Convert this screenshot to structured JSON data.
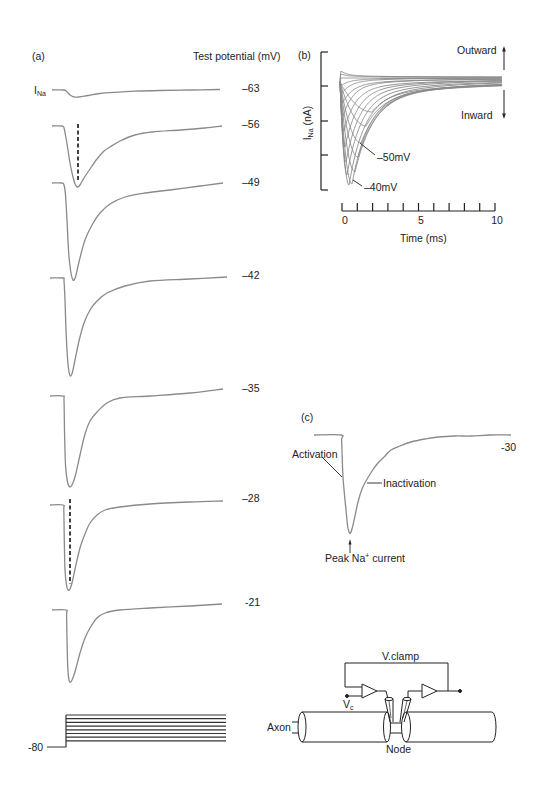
{
  "panels": {
    "a": {
      "label": "(a)",
      "legend_title": "Test potential (mV)",
      "current_main": "I",
      "current_sub": "Na",
      "holding_label": "-80",
      "trace_labels": [
        "–63",
        "–56",
        "–49",
        "–42",
        "–35",
        "–28",
        "-21"
      ]
    },
    "b": {
      "label": "(b)",
      "ylabel_main": "I",
      "ylabel_sub": "Na",
      "ylabel_unit": " (nA)",
      "xlabel": "Time (ms)",
      "xtick_labels": [
        "0",
        "5",
        "10"
      ],
      "outward_label": "Outward",
      "inward_label": "Inward",
      "annotation_50": "–50mV",
      "annotation_40": "–40mV"
    },
    "c": {
      "label": "(c)",
      "potential_label": "-30",
      "activation_label": "Activation",
      "inactivation_label": "Inactivation",
      "peak_main": "Peak Na",
      "peak_sup": "+",
      "peak_rest": " current"
    },
    "d": {
      "vclamp_label": "V.clamp",
      "vc_main": "V",
      "vc_sub": "c",
      "axon_label": "Axon",
      "node_label": "Node"
    }
  },
  "colors": {
    "trace": "#8a8a8a",
    "axis": "#222222",
    "step": "#333333",
    "text": "#222222",
    "background": "#ffffff"
  },
  "chart_data": [
    {
      "panel": "a",
      "type": "line",
      "title": "(a)",
      "legend_title": "Test potential (mV)",
      "ylabel": "INa",
      "xlabel": "",
      "grid": false,
      "voltage_protocol": {
        "holding_potential_mV": -80,
        "num_test_steps": 8,
        "step_levels_px": [
          715,
          718.7,
          722.4,
          726.1,
          729.8,
          733.5,
          737.2,
          740.9
        ]
      },
      "series": [
        {
          "name": "-63",
          "test_potential_mV": -63,
          "relative_peak": 0.07,
          "points_px": [
            [
              52,
              90
            ],
            [
              64,
              90
            ],
            [
              67,
              92
            ],
            [
              70,
              95
            ],
            [
              74,
              97
            ],
            [
              79,
              97
            ],
            [
              88,
              95.5
            ],
            [
              100,
              93.5
            ],
            [
              115,
              92.3
            ],
            [
              135,
              91.2
            ],
            [
              160,
              90.5
            ],
            [
              190,
              90
            ],
            [
              220,
              89.5
            ]
          ]
        },
        {
          "name": "-56",
          "test_potential_mV": -56,
          "relative_peak": 0.6,
          "points_px": [
            [
              52,
              126
            ],
            [
              62,
              126
            ],
            [
              64,
              128
            ],
            [
              66,
              138
            ],
            [
              68,
              150
            ],
            [
              70,
              163
            ],
            [
              72.5,
              175
            ],
            [
              75,
              184
            ],
            [
              77.5,
              187
            ],
            [
              80,
              185
            ],
            [
              84,
              178
            ],
            [
              90,
              169
            ],
            [
              97,
              159
            ],
            [
              104,
              151
            ],
            [
              110,
              147
            ],
            [
              120,
              141
            ],
            [
              135,
              135
            ],
            [
              152,
              132
            ],
            [
              180,
              130
            ],
            [
              205,
              128
            ],
            [
              222,
              126
            ]
          ]
        },
        {
          "name": "-49",
          "test_potential_mV": -49,
          "relative_peak": 0.97,
          "points_px": [
            [
              52,
              183
            ],
            [
              62,
              183
            ],
            [
              64,
              185
            ],
            [
              65.5,
              195
            ],
            [
              67,
              220
            ],
            [
              68.5,
              250
            ],
            [
              70.5,
              270
            ],
            [
              73,
              280
            ],
            [
              75.5,
              277
            ],
            [
              78,
              266
            ],
            [
              81,
              254
            ],
            [
              85,
              240
            ],
            [
              92,
              225
            ],
            [
              100,
              213
            ],
            [
              110,
              204
            ],
            [
              125,
              197
            ],
            [
              145,
              193
            ],
            [
              170,
              190
            ],
            [
              200,
              186
            ],
            [
              223,
              183
            ]
          ]
        },
        {
          "name": "-42",
          "test_potential_mV": -42,
          "relative_peak": 1.0,
          "points_px": [
            [
              50,
              278
            ],
            [
              63,
              278
            ],
            [
              64,
              281
            ],
            [
              65,
              300
            ],
            [
              66,
              330
            ],
            [
              67.5,
              358
            ],
            [
              69,
              372
            ],
            [
              70.5,
              376
            ],
            [
              72.5,
              372
            ],
            [
              75,
              360
            ],
            [
              79,
              341
            ],
            [
              84,
              323
            ],
            [
              90,
              310
            ],
            [
              97,
              301
            ],
            [
              107,
              293
            ],
            [
              125,
              286
            ],
            [
              150,
              281
            ],
            [
              190,
              279
            ],
            [
              227,
              277
            ]
          ]
        },
        {
          "name": "-35",
          "test_potential_mV": -35,
          "relative_peak": 0.94,
          "points_px": [
            [
              50,
              396
            ],
            [
              63,
              396
            ],
            [
              64,
              400
            ],
            [
              64.5,
              430
            ],
            [
              65.5,
              465
            ],
            [
              67.5,
              482
            ],
            [
              70,
              487
            ],
            [
              72.5,
              484
            ],
            [
              75.5,
              475
            ],
            [
              80,
              455
            ],
            [
              85,
              434
            ],
            [
              90,
              421
            ],
            [
              97,
              412
            ],
            [
              107,
              403
            ],
            [
              120,
              398
            ],
            [
              150,
              396
            ],
            [
              190,
              393
            ],
            [
              223,
              389
            ]
          ]
        },
        {
          "name": "-28",
          "test_potential_mV": -28,
          "relative_peak": 0.87,
          "points_px": [
            [
              50,
              505
            ],
            [
              63,
              505
            ],
            [
              63.8,
              510
            ],
            [
              64.3,
              540
            ],
            [
              65,
              570
            ],
            [
              66.5,
              585
            ],
            [
              68,
              590
            ],
            [
              70,
              589
            ],
            [
              72.5,
              581
            ],
            [
              75.5,
              567
            ],
            [
              80,
              548
            ],
            [
              85,
              534
            ],
            [
              90,
              523
            ],
            [
              97,
              515
            ],
            [
              105,
              510
            ],
            [
              120,
              507
            ],
            [
              150,
              504
            ],
            [
              190,
              502
            ],
            [
              223,
              501
            ]
          ]
        },
        {
          "name": "-21",
          "test_potential_mV": -21,
          "relative_peak": 0.74,
          "points_px": [
            [
              52,
              610
            ],
            [
              66,
              610
            ],
            [
              66.6,
              615
            ],
            [
              67,
              640
            ],
            [
              67.8,
              668
            ],
            [
              69,
              680
            ],
            [
              70.5,
              682
            ],
            [
              72.5,
              679
            ],
            [
              75.5,
              670
            ],
            [
              80,
              653
            ],
            [
              85,
              638
            ],
            [
              90,
              628
            ],
            [
              97,
              618
            ],
            [
              105,
              613
            ],
            [
              120,
              610
            ],
            [
              150,
              608
            ],
            [
              190,
              606
            ],
            [
              222,
              604
            ]
          ]
        }
      ],
      "annotations": [
        {
          "type": "dashed-line",
          "trace": "-56",
          "points_px": [
            [
              78,
              124
            ],
            [
              78,
              182
            ]
          ]
        },
        {
          "type": "dashed-line",
          "trace": "-28",
          "points_px": [
            [
              70,
              499
            ],
            [
              70,
              584
            ]
          ]
        }
      ]
    },
    {
      "panel": "b",
      "type": "line",
      "title": "(b)",
      "xlabel": "Time (ms)",
      "ylabel": "INa (nA)",
      "xlim": [
        0,
        10
      ],
      "xticks": [
        0,
        5,
        10
      ],
      "minor_xtick_step": 1,
      "ytick_count": 5,
      "ytick_labels": [],
      "grid": false,
      "annotations": [
        "–50mV",
        "–40mV",
        "Outward (up arrow)",
        "Inward (down arrow)"
      ],
      "render": {
        "x0": 340,
        "x1": 503,
        "y0": 82
      },
      "series": [
        {
          "label": null,
          "xp": 341,
          "yp": 71,
          "t1": 6,
          "t2": 40,
          "f": 0.7,
          "ye": 77
        },
        {
          "label": null,
          "xp": 341,
          "yp": 74,
          "t1": 6,
          "t2": 40,
          "f": 0.7,
          "ye": 77
        },
        {
          "label": null,
          "xp": 341.5,
          "yp": 78,
          "t1": 8,
          "t2": 40,
          "f": 0.7,
          "ye": 78
        },
        {
          "label": null,
          "xp": 342,
          "yp": 85,
          "t1": 8,
          "t2": 40,
          "f": 0.7,
          "ye": 78
        },
        {
          "label": null,
          "xp": 342,
          "yp": 93,
          "t1": 9,
          "t2": 45,
          "f": 0.75,
          "ye": 78
        },
        {
          "label": null,
          "xp": 342.5,
          "yp": 103,
          "t1": 10,
          "t2": 50,
          "f": 0.75,
          "ye": 79
        },
        {
          "label": null,
          "xp": 343,
          "yp": 116,
          "t1": 10,
          "t2": 50,
          "f": 0.8,
          "ye": 79
        },
        {
          "label": null,
          "xp": 344,
          "yp": 131,
          "t1": 11,
          "t2": 55,
          "f": 0.8,
          "ye": 80
        },
        {
          "label": null,
          "xp": 345,
          "yp": 147,
          "t1": 12,
          "t2": 55,
          "f": 0.8,
          "ye": 80
        },
        {
          "label": null,
          "xp": 346,
          "yp": 162,
          "t1": 13,
          "t2": 60,
          "f": 0.8,
          "ye": 80
        },
        {
          "label": null,
          "xp": 347,
          "yp": 175,
          "t1": 14,
          "t2": 60,
          "f": 0.8,
          "ye": 81
        },
        {
          "label": "–40mV",
          "xp": 349,
          "yp": 185,
          "t1": 15,
          "t2": 65,
          "f": 0.8,
          "ye": 81
        },
        {
          "label": null,
          "xp": 352,
          "yp": 184,
          "t1": 16,
          "t2": 70,
          "f": 0.8,
          "ye": 82
        },
        {
          "label": null,
          "xp": 355,
          "yp": 172,
          "t1": 18,
          "t2": 75,
          "f": 0.8,
          "ye": 82
        },
        {
          "label": null,
          "xp": 358,
          "yp": 157,
          "t1": 19,
          "t2": 80,
          "f": 0.8,
          "ye": 83
        },
        {
          "label": "–50mV",
          "xp": 361,
          "yp": 143,
          "t1": 20,
          "t2": 85,
          "f": 0.8,
          "ye": 83
        },
        {
          "label": null,
          "xp": 366,
          "yp": 126,
          "t1": 18,
          "t2": 90,
          "f": 0.7,
          "ye": 83
        },
        {
          "label": null,
          "xp": 372,
          "yp": 112,
          "t1": 16,
          "t2": 95,
          "f": 0.6,
          "ye": 82
        }
      ]
    },
    {
      "panel": "c",
      "type": "line",
      "title": "(c)",
      "test_potential_mV": -30,
      "annotations": [
        "Activation",
        "Inactivation",
        "Peak Na+ current"
      ],
      "series": [
        {
          "name": "-30",
          "points_px": [
            [
              314,
              435
            ],
            [
              341,
              435
            ],
            [
              341.6,
              440
            ],
            [
              342.3,
              460
            ],
            [
              343,
              477
            ],
            [
              344.5,
              495
            ],
            [
              346,
              510
            ],
            [
              347.5,
              525
            ],
            [
              349,
              532
            ],
            [
              350.5,
              533
            ],
            [
              352.5,
              527
            ],
            [
              355,
              516
            ],
            [
              358,
              502
            ],
            [
              362,
              489
            ],
            [
              366,
              481
            ],
            [
              372,
              471
            ],
            [
              378,
              463
            ],
            [
              385,
              456
            ],
            [
              391,
              450
            ],
            [
              400,
              446
            ],
            [
              411,
              442
            ],
            [
              425,
              439
            ],
            [
              438,
              437
            ],
            [
              455,
              436
            ],
            [
              471,
              436
            ],
            [
              490,
              435
            ],
            [
              511,
              435
            ]
          ]
        }
      ]
    }
  ]
}
